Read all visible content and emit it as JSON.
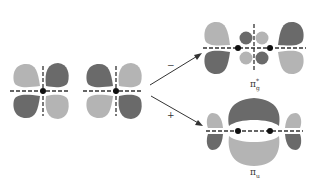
{
  "colors": {
    "dark_lobe": "#6a6a6a",
    "light_lobe": "#b4b4b4",
    "axis": "#333333",
    "nucleus": "#111111",
    "arrow": "#333333"
  },
  "labels": {
    "minus_sign": "−",
    "plus_sign": "+",
    "antibonding": "π",
    "antibonding_sup": "*",
    "antibonding_sub": "g",
    "bonding": "π",
    "bonding_sub": "u"
  },
  "orbitals": {
    "left_atom_1": {
      "type": "d-like",
      "pattern": [
        "light",
        "dark",
        "dark",
        "light"
      ]
    },
    "left_atom_2": {
      "type": "d-like",
      "pattern": [
        "dark",
        "light",
        "light",
        "dark"
      ]
    },
    "pi_g_star": {
      "name": "pi-g-star antibonding",
      "combination": "minus"
    },
    "pi_u": {
      "name": "pi-u bonding",
      "combination": "plus"
    }
  }
}
